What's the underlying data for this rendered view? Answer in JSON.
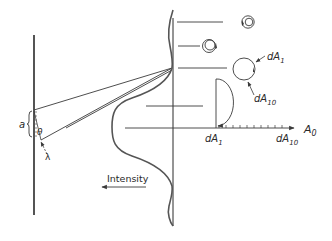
{
  "figure": {
    "colors": {
      "stroke": "#3a3a3a",
      "text": "#2a2a2a",
      "background": "#ffffff"
    }
  },
  "slit": {
    "width_label": "a",
    "angle_label": "θ",
    "wavelength_label": "λ"
  },
  "intensity_axis": {
    "label": "Intensity"
  },
  "phasors": {
    "circle_label_start": "dA",
    "circle_label_start_sub": "1",
    "circle_label_end": "dA",
    "circle_label_end_sub": "10",
    "line_label_start": "dA",
    "line_label_start_sub": "1",
    "line_label_end": "dA",
    "line_label_end_sub": "10",
    "resultant_label": "A",
    "resultant_label_sub": "0"
  }
}
